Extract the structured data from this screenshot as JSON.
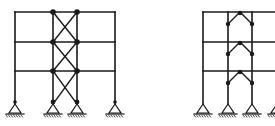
{
  "diagram": {
    "type": "structural-frames",
    "colors": {
      "line": "#1a1a1a",
      "background": "#ffffff"
    },
    "frames": [
      {
        "name": "x-braced-frame",
        "columns_x": [
          15,
          53,
          77,
          115
        ],
        "beams_y": [
          12,
          42,
          71
        ],
        "base_y": 104,
        "braced_bay": [
          53,
          77
        ],
        "bracing": "X"
      },
      {
        "name": "chevron-braced-frame",
        "columns_x": [
          203,
          228,
          252,
          277
        ],
        "beams_y": [
          12,
          42,
          71
        ],
        "base_y": 104,
        "braced_bay": [
          228,
          252
        ],
        "bracing": "inverted-V"
      }
    ]
  }
}
